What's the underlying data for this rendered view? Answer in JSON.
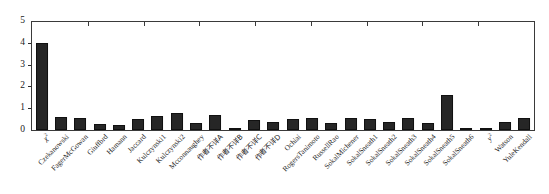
{
  "chart_data": {
    "type": "bar",
    "title": "",
    "subtitle": "",
    "xlabel": "",
    "ylabel": "",
    "ylim": [
      0,
      5
    ],
    "ytick_labels": [
      "0",
      "1",
      "2",
      "3",
      "4",
      "5"
    ],
    "ytick_values": [
      0,
      1,
      2,
      3,
      4,
      5
    ],
    "grid": false,
    "legend": null,
    "legend_position": "none",
    "bar_color": "#262626",
    "axis_color": "#3a3a3a",
    "categories": [
      "χ²",
      "Czekanowski",
      "FagerMcGowan",
      "Giuffbrd",
      "Hamann",
      "Jaccard",
      "Kulczynski1",
      "Kulczynski2",
      "Mcconnaughey",
      "作者不详A",
      "作者不详B",
      "作者不详C",
      "作者不详D",
      "Ochiai",
      "RogersTanimoto",
      "RussellRao",
      "SokalMichener",
      "SokalSneath1",
      "SokalSneath2",
      "SokalSneath3",
      "SokalSneath4",
      "SokalSneath5",
      "SokalSneath6",
      "y²",
      "Watson",
      "YuleKendall"
    ],
    "values": [
      4.0,
      0.6,
      0.55,
      0.26,
      0.22,
      0.5,
      0.66,
      0.8,
      0.3,
      0.68,
      0.05,
      0.44,
      0.36,
      0.5,
      0.55,
      0.3,
      0.56,
      0.5,
      0.36,
      0.55,
      0.3,
      1.6,
      0.07,
      0.1,
      0.36,
      0.55
    ],
    "label_markup": [
      "<i>χ</i><sup>2</sup>",
      "Czekanowski",
      "FagerMcGowan",
      "Giuffbrd",
      "Hamann",
      "Jaccard",
      "Kulczynski1",
      "Kulczynski2",
      "Mcconnaughey",
      "作者不详A",
      "作者不详B",
      "作者不详C",
      "作者不详D",
      "Ochiai",
      "RogersTanimoto",
      "RussellRao",
      "SokalMichener",
      "SokalSneath1",
      "SokalSneath2",
      "SokalSneath3",
      "SokalSneath4",
      "SokalSneath5",
      "SokalSneath6",
      "<i>y</i><sup>2</sup>",
      "Watson",
      "YuleKendall"
    ],
    "cjk_flags": [
      false,
      false,
      false,
      false,
      false,
      false,
      false,
      false,
      false,
      true,
      true,
      true,
      true,
      false,
      false,
      false,
      false,
      false,
      false,
      false,
      false,
      false,
      false,
      false,
      false,
      false
    ]
  }
}
